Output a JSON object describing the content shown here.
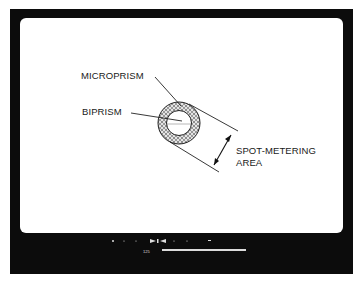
{
  "diagram": {
    "labels": {
      "microprism": "MICROPRISM",
      "biprism": "BIPRISM",
      "spot_metering_line1": "SPOT-METERING",
      "spot_metering_line2": "AREA"
    }
  },
  "viewfinder_display": {
    "shutter_speed": "125",
    "scale_markers": [
      "+",
      "·",
      "·",
      "▶",
      "▮",
      "◀",
      "·",
      "·",
      "−"
    ],
    "colors": {
      "frame": "#0c0c0c",
      "screen": "#ffffff",
      "display_text": "#dcdcdc"
    }
  }
}
